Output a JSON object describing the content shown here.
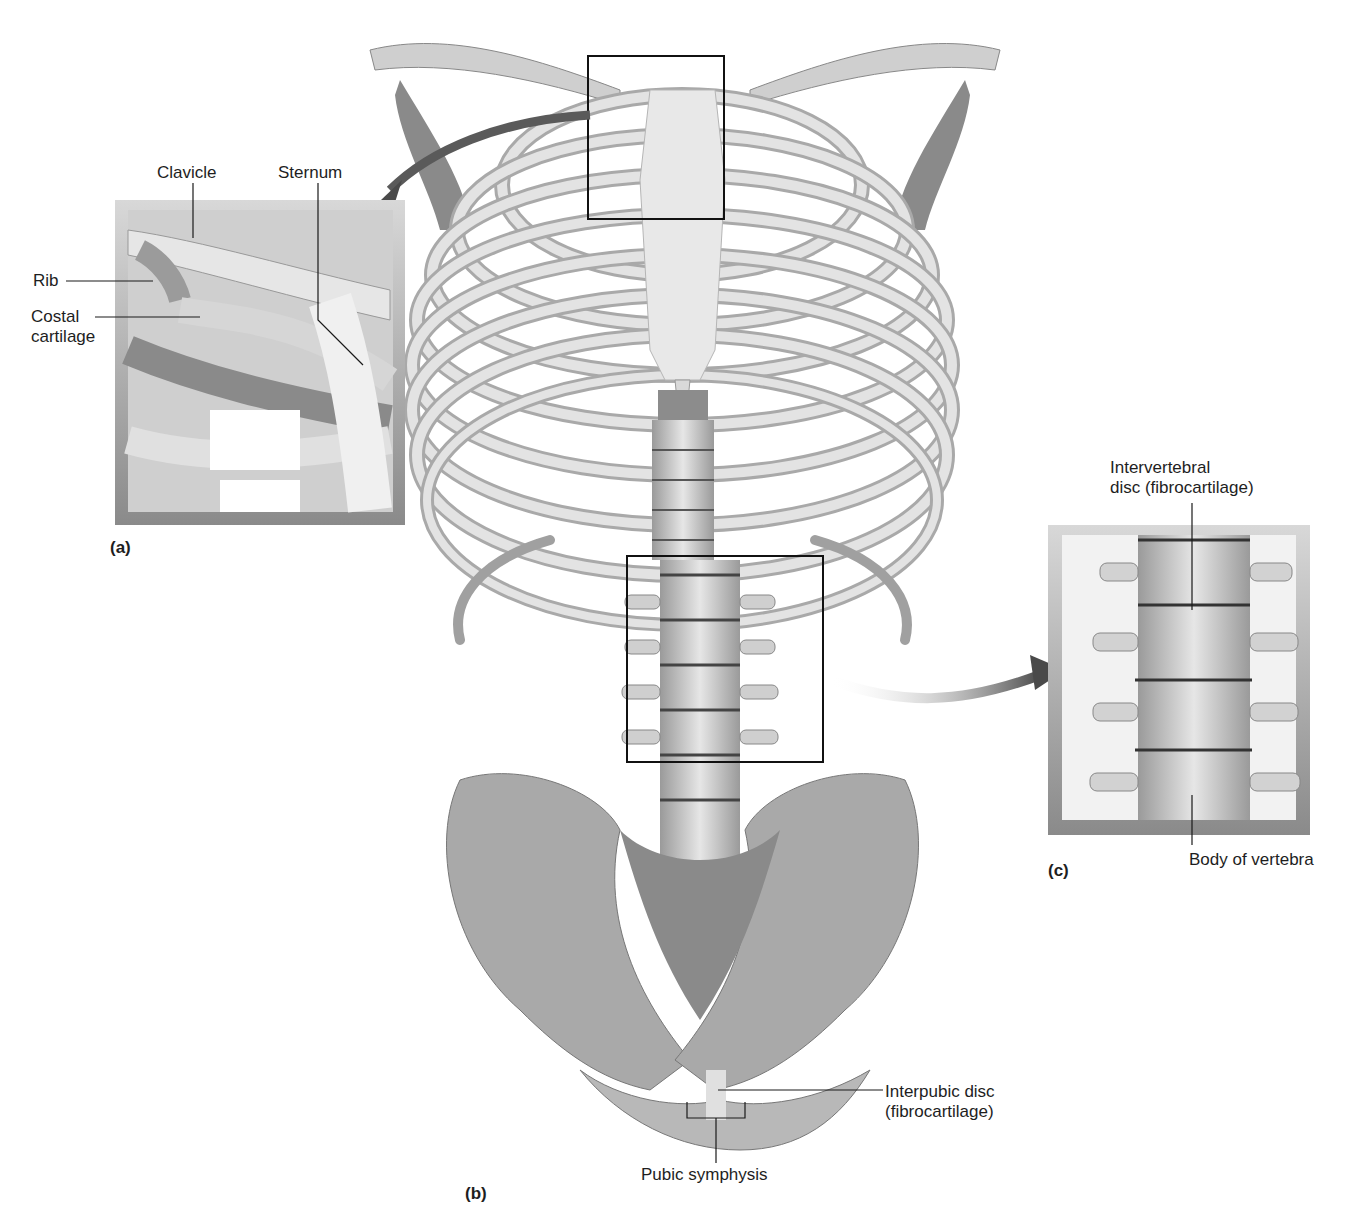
{
  "figure": {
    "panels": [
      {
        "id": "a",
        "tag": "(a)",
        "labels": [
          "Clavicle",
          "Sternum",
          "Rib",
          "Costal cartilage"
        ]
      },
      {
        "id": "b",
        "tag": "(b)",
        "labels": [
          "Interpubic disc (fibrocartilage)",
          "Pubic symphysis"
        ]
      },
      {
        "id": "c",
        "tag": "(c)",
        "labels": [
          "Intervertebral disc (fibrocartilage)",
          "Body of vertebra"
        ]
      }
    ]
  },
  "labels": {
    "clavicle": "Clavicle",
    "sternum": "Sternum",
    "rib": "Rib",
    "costal_cartilage": "Costal\ncartilage",
    "intervertebral_disc": "Intervertebral\ndisc (fibrocartilage)",
    "body_of_vertebra": "Body of vertebra",
    "interpubic_disc": "Interpubic disc\n(fibrocartilage)",
    "pubic_symphysis": "Pubic symphysis"
  },
  "tags": {
    "a": "(a)",
    "b": "(b)",
    "c": "(c)"
  },
  "colors": {
    "bone_light": "#e2e2e2",
    "bone_mid": "#bdbdbd",
    "bone_dark": "#7a7a7a",
    "frame": "#8e8e8e",
    "arrow": "#555555",
    "line": "#1a1a1a"
  }
}
